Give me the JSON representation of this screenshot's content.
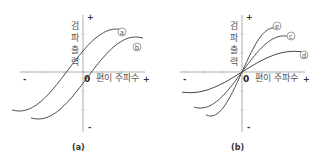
{
  "panels": [
    {
      "caption": "(a)",
      "y_axis_label": [
        "검",
        "파",
        "출",
        "력"
      ],
      "x_axis_label": "편이 주파수",
      "origin_label": "0",
      "plus_sign": "+",
      "minus_sign": "-",
      "curves": [
        {
          "label": "a",
          "offset": 0.18
        },
        {
          "label": "b",
          "offset": 0.0
        }
      ]
    },
    {
      "caption": "(b)",
      "y_axis_label": [
        "검",
        "파",
        "출",
        "력"
      ],
      "x_axis_label": "편이 주파수",
      "origin_label": "0",
      "plus_sign": "+",
      "minus_sign": "-",
      "curves": [
        {
          "label": "e",
          "gain": 1.0
        },
        {
          "label": "c",
          "gain": 0.7
        },
        {
          "label": "d",
          "gain": 0.4
        }
      ]
    }
  ]
}
